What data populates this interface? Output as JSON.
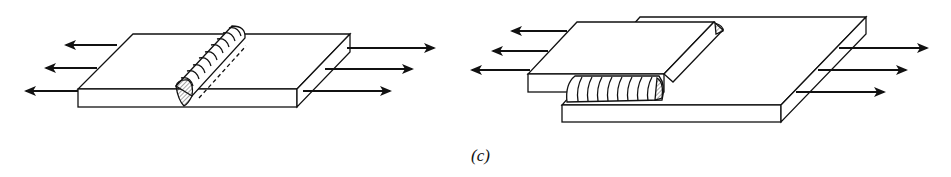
{
  "figure": {
    "caption": "(c)",
    "panels": [
      {
        "name": "butt-weld-plate",
        "description": "Single plate with transverse weld bead across top, loaded in tension",
        "arrows_left": 3,
        "arrows_right": 3
      },
      {
        "name": "lap-joint-fillet-weld",
        "description": "Two overlapping plates joined by fillet weld, loaded in tension",
        "arrows_left": 3,
        "arrows_right": 3
      }
    ]
  },
  "colors": {
    "line": "#111111",
    "background": "#ffffff"
  }
}
